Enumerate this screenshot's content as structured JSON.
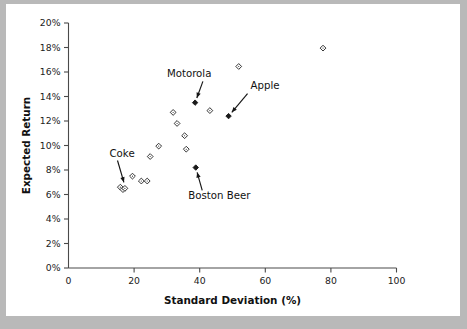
{
  "figure": {
    "background_color": "#b9b9b9",
    "plate_color": "#ffffff",
    "accent_color": "#1a1a1a"
  },
  "chart_data": {
    "type": "scatter",
    "title": "",
    "subtitle": "",
    "xlabel": "Standard Deviation (%)",
    "ylabel": "Expected Return",
    "xlim": [
      0,
      100
    ],
    "ylim": [
      0,
      20
    ],
    "grid": false,
    "legend": null,
    "x_ticks": [
      0,
      20,
      40,
      60,
      80,
      100
    ],
    "x_tick_labels": [
      "0",
      "20",
      "40",
      "60",
      "80",
      "100"
    ],
    "y_ticks": [
      0,
      2,
      4,
      6,
      8,
      10,
      12,
      14,
      16,
      18,
      20
    ],
    "y_tick_labels": [
      "0%",
      "2%",
      "4%",
      "6%",
      "8%",
      "10%",
      "12%",
      "14%",
      "16%",
      "18%",
      "20%"
    ],
    "marker_styles": {
      "open": "open-diamond",
      "highlighted": "filled-diamond"
    },
    "points": [
      {
        "x": 15.8,
        "y": 6.6,
        "style": "open",
        "label": ""
      },
      {
        "x": 16.6,
        "y": 6.4,
        "style": "open",
        "label": ""
      },
      {
        "x": 17.2,
        "y": 6.5,
        "style": "open",
        "label": "Coke"
      },
      {
        "x": 19.5,
        "y": 7.5,
        "style": "open",
        "label": ""
      },
      {
        "x": 22.2,
        "y": 7.1,
        "style": "open",
        "label": ""
      },
      {
        "x": 24.0,
        "y": 7.1,
        "style": "open",
        "label": ""
      },
      {
        "x": 24.9,
        "y": 9.1,
        "style": "open",
        "label": ""
      },
      {
        "x": 27.5,
        "y": 9.95,
        "style": "open",
        "label": ""
      },
      {
        "x": 31.9,
        "y": 12.7,
        "style": "open",
        "label": ""
      },
      {
        "x": 33.1,
        "y": 11.8,
        "style": "open",
        "label": ""
      },
      {
        "x": 35.4,
        "y": 10.8,
        "style": "open",
        "label": ""
      },
      {
        "x": 35.9,
        "y": 9.7,
        "style": "open",
        "label": ""
      },
      {
        "x": 38.6,
        "y": 13.5,
        "style": "highlighted",
        "label": "Motorola"
      },
      {
        "x": 38.8,
        "y": 8.2,
        "style": "highlighted",
        "label": "Boston Beer"
      },
      {
        "x": 43.1,
        "y": 12.85,
        "style": "open",
        "label": ""
      },
      {
        "x": 48.8,
        "y": 12.4,
        "style": "highlighted",
        "label": "Apple"
      },
      {
        "x": 51.9,
        "y": 16.45,
        "style": "open",
        "label": ""
      },
      {
        "x": 77.6,
        "y": 17.95,
        "style": "open",
        "label": ""
      }
    ],
    "annotations": [
      {
        "text": "Motorola",
        "target_x": 38.6,
        "target_y": 13.5,
        "text_x": 30.0,
        "text_y": 15.6,
        "arrow": "down-right"
      },
      {
        "text": "Apple",
        "target_x": 48.8,
        "target_y": 12.4,
        "text_x": 55.5,
        "text_y": 14.6,
        "arrow": "down-left"
      },
      {
        "text": "Coke",
        "target_x": 17.2,
        "target_y": 6.5,
        "text_x": 12.5,
        "text_y": 9.1,
        "arrow": "down"
      },
      {
        "text": "Boston Beer",
        "target_x": 38.8,
        "target_y": 8.2,
        "text_x": 36.5,
        "text_y": 5.6,
        "arrow": "up-left"
      }
    ]
  }
}
